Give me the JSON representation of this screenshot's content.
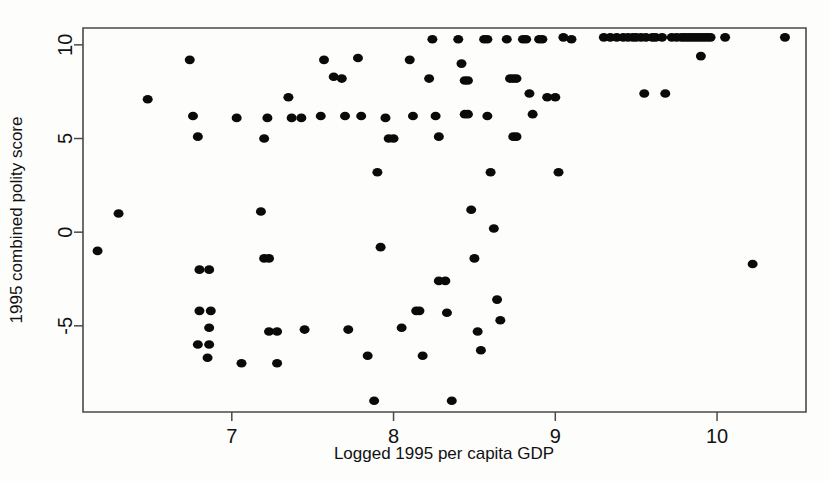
{
  "chart_data": {
    "type": "scatter",
    "title": "",
    "xlabel": "Logged 1995 per capita GDP",
    "ylabel": "1995 combined polity score",
    "xlim": [
      6.08,
      10.55
    ],
    "ylim": [
      -9.6,
      10.9
    ],
    "xticks": [
      7,
      8,
      9,
      10
    ],
    "xtick_labels": [
      "7",
      "8",
      "9",
      "10"
    ],
    "yticks": [
      -5,
      0,
      5,
      10
    ],
    "ytick_labels": [
      "-5",
      "0",
      "5",
      "10"
    ],
    "grid": false,
    "legend": false,
    "marker": "filled-circle",
    "marker_color": "#0a0a0a",
    "marker_size": 5,
    "n_points": 145,
    "points": [
      [
        6.17,
        -1.0
      ],
      [
        6.3,
        1.0
      ],
      [
        6.48,
        7.1
      ],
      [
        6.74,
        9.2
      ],
      [
        6.76,
        6.2
      ],
      [
        6.79,
        5.1
      ],
      [
        6.8,
        -2.0
      ],
      [
        6.86,
        -2.0
      ],
      [
        6.8,
        -4.2
      ],
      [
        6.87,
        -4.2
      ],
      [
        6.86,
        -5.1
      ],
      [
        6.79,
        -6.0
      ],
      [
        6.86,
        -6.0
      ],
      [
        6.85,
        -6.7
      ],
      [
        7.03,
        6.1
      ],
      [
        7.06,
        -7.0
      ],
      [
        7.18,
        1.1
      ],
      [
        7.2,
        -1.4
      ],
      [
        7.23,
        -1.4
      ],
      [
        7.22,
        6.1
      ],
      [
        7.2,
        5.0
      ],
      [
        7.23,
        -5.3
      ],
      [
        7.28,
        -5.3
      ],
      [
        7.28,
        -7.0
      ],
      [
        7.35,
        7.2
      ],
      [
        7.37,
        6.1
      ],
      [
        7.43,
        6.1
      ],
      [
        7.45,
        -5.2
      ],
      [
        7.55,
        6.2
      ],
      [
        7.57,
        9.2
      ],
      [
        7.63,
        8.3
      ],
      [
        7.68,
        8.2
      ],
      [
        7.7,
        6.2
      ],
      [
        7.72,
        -5.2
      ],
      [
        7.78,
        9.3
      ],
      [
        7.8,
        6.2
      ],
      [
        7.84,
        -6.6
      ],
      [
        7.88,
        -9.0
      ],
      [
        7.9,
        3.2
      ],
      [
        7.92,
        -0.8
      ],
      [
        7.95,
        6.1
      ],
      [
        7.97,
        5.0
      ],
      [
        8.0,
        5.0
      ],
      [
        8.05,
        -5.1
      ],
      [
        8.1,
        9.2
      ],
      [
        8.12,
        6.2
      ],
      [
        8.14,
        -4.2
      ],
      [
        8.16,
        -4.2
      ],
      [
        8.18,
        -6.6
      ],
      [
        8.22,
        8.2
      ],
      [
        8.24,
        10.3
      ],
      [
        8.26,
        6.2
      ],
      [
        8.28,
        5.1
      ],
      [
        8.28,
        -2.6
      ],
      [
        8.32,
        -2.6
      ],
      [
        8.33,
        -4.3
      ],
      [
        8.36,
        -9.0
      ],
      [
        8.4,
        10.3
      ],
      [
        8.42,
        9.0
      ],
      [
        8.44,
        8.1
      ],
      [
        8.46,
        8.1
      ],
      [
        8.44,
        6.3
      ],
      [
        8.46,
        6.3
      ],
      [
        8.48,
        1.2
      ],
      [
        8.5,
        -1.4
      ],
      [
        8.52,
        -5.3
      ],
      [
        8.54,
        -6.3
      ],
      [
        8.56,
        10.3
      ],
      [
        8.58,
        10.3
      ],
      [
        8.58,
        6.2
      ],
      [
        8.6,
        3.2
      ],
      [
        8.62,
        0.2
      ],
      [
        8.64,
        -3.6
      ],
      [
        8.66,
        -4.7
      ],
      [
        8.7,
        10.3
      ],
      [
        8.72,
        8.2
      ],
      [
        8.74,
        8.2
      ],
      [
        8.76,
        8.2
      ],
      [
        8.74,
        5.1
      ],
      [
        8.76,
        5.1
      ],
      [
        8.8,
        10.3
      ],
      [
        8.82,
        10.3
      ],
      [
        8.84,
        7.4
      ],
      [
        8.86,
        6.3
      ],
      [
        8.9,
        10.3
      ],
      [
        8.92,
        10.3
      ],
      [
        8.95,
        7.2
      ],
      [
        9.0,
        7.2
      ],
      [
        9.02,
        3.2
      ],
      [
        9.05,
        10.4
      ],
      [
        9.1,
        10.3
      ],
      [
        9.3,
        10.4
      ],
      [
        9.34,
        10.4
      ],
      [
        9.38,
        10.4
      ],
      [
        9.42,
        10.4
      ],
      [
        9.45,
        10.4
      ],
      [
        9.48,
        10.4
      ],
      [
        9.5,
        10.4
      ],
      [
        9.53,
        10.4
      ],
      [
        9.56,
        10.4
      ],
      [
        9.6,
        10.4
      ],
      [
        9.62,
        10.4
      ],
      [
        9.66,
        10.4
      ],
      [
        9.55,
        7.4
      ],
      [
        9.68,
        7.4
      ],
      [
        9.72,
        10.4
      ],
      [
        9.75,
        10.4
      ],
      [
        9.78,
        10.4
      ],
      [
        9.8,
        10.4
      ],
      [
        9.82,
        10.4
      ],
      [
        9.84,
        10.4
      ],
      [
        9.86,
        10.4
      ],
      [
        9.88,
        10.4
      ],
      [
        9.9,
        10.4
      ],
      [
        9.92,
        10.4
      ],
      [
        9.94,
        10.4
      ],
      [
        9.96,
        10.4
      ],
      [
        9.9,
        9.4
      ],
      [
        10.05,
        10.4
      ],
      [
        10.22,
        -1.7
      ],
      [
        10.42,
        10.4
      ]
    ]
  },
  "figure": {
    "background_color": "#ffffff",
    "axis_color": "#4a4a4a",
    "text_color": "#111111"
  }
}
